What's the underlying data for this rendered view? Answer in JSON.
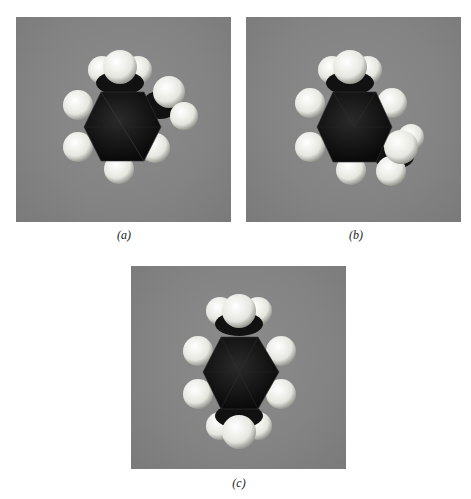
{
  "figure": {
    "panels": [
      {
        "id": "a",
        "caption": "(a)",
        "description": "space-filling model, methyl groups at adjacent ring positions (ortho)"
      },
      {
        "id": "b",
        "caption": "(b)",
        "description": "space-filling model, methyl groups at 1,3 ring positions (meta)"
      },
      {
        "id": "c",
        "caption": "(c)",
        "description": "space-filling model, methyl groups at opposite ring positions (para)"
      }
    ],
    "colors": {
      "background": "#858585",
      "carbon": "#141414",
      "hydrogen": "#f2f2ec"
    }
  }
}
